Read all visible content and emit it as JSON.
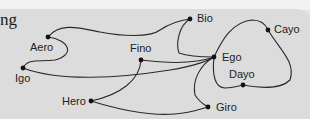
{
  "heading_fragment": "ng",
  "colors": {
    "background": "#dcdcdc",
    "edge": "#2a2a2a",
    "node": "#111111",
    "label": "#222222"
  },
  "nodes": [
    {
      "id": "aero",
      "label": "Aero",
      "x": 48,
      "y": 37,
      "lx": 30,
      "ly": 51
    },
    {
      "id": "bio",
      "label": "Bio",
      "x": 190,
      "y": 19,
      "lx": 197,
      "ly": 22
    },
    {
      "id": "cayo",
      "label": "Cayo",
      "x": 268,
      "y": 30,
      "lx": 274,
      "ly": 33
    },
    {
      "id": "fino",
      "label": "Fino",
      "x": 141,
      "y": 60,
      "lx": 130,
      "ly": 52
    },
    {
      "id": "ego",
      "label": "Ego",
      "x": 214,
      "y": 57,
      "lx": 222,
      "ly": 61
    },
    {
      "id": "igo",
      "label": "Igo",
      "x": 23,
      "y": 68,
      "lx": 15,
      "ly": 82
    },
    {
      "id": "dayo",
      "label": "Dayo",
      "x": 243,
      "y": 85,
      "lx": 229,
      "ly": 78
    },
    {
      "id": "hero",
      "label": "Hero",
      "x": 91,
      "y": 101,
      "lx": 62,
      "ly": 105
    },
    {
      "id": "giro",
      "label": "Giro",
      "x": 208,
      "y": 107,
      "lx": 216,
      "ly": 111
    }
  ],
  "edges": [
    {
      "from": "aero",
      "to": "bio",
      "path": "M48,37 C60,22 80,28 100,32 C120,36 150,38 160,30 C172,22 182,20 190,19"
    },
    {
      "from": "aero",
      "to": "igo",
      "path": "M48,37 C70,40 75,55 55,60 C38,62 28,58 23,68"
    },
    {
      "from": "igo",
      "to": "ego",
      "path": "M23,68 C60,82 120,78 170,70 C195,66 210,60 214,57"
    },
    {
      "from": "fino",
      "to": "ego",
      "path": "M141,60 C165,63 195,64 214,57"
    },
    {
      "from": "fino",
      "to": "hero",
      "path": "M141,60 C140,80 120,95 91,101"
    },
    {
      "from": "bio",
      "to": "ego",
      "path": "M190,19 C178,26 176,45 179,53 C190,57 205,57 214,57"
    },
    {
      "from": "ego",
      "to": "cayo",
      "path": "M214,57 C222,40 232,22 252,20 C262,20 266,25 268,30"
    },
    {
      "from": "cayo",
      "to": "dayo",
      "path": "M268,30 C280,50 296,62 290,80 C280,90 260,88 243,85"
    },
    {
      "from": "ego",
      "to": "dayo",
      "path": "M214,57 C212,75 215,88 225,88 C233,88 238,86 243,85"
    },
    {
      "from": "ego",
      "to": "giro",
      "path": "M214,57 C200,65 192,80 195,95 C200,103 205,105 208,107"
    },
    {
      "from": "hero",
      "to": "giro",
      "path": "M91,101 C120,110 150,116 175,114 C192,113 200,109 208,107"
    }
  ]
}
